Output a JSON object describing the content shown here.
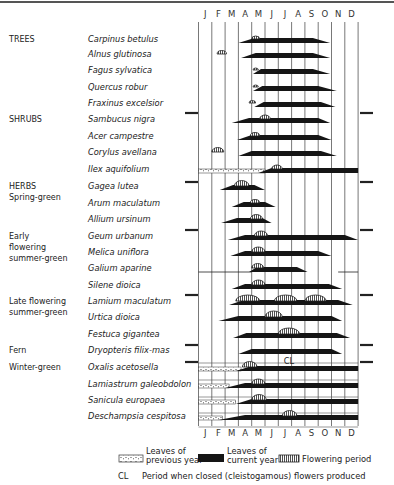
{
  "chart_data": {
    "type": "phenology-chart",
    "title": "",
    "x_axis": {
      "label": "",
      "months": [
        "J",
        "F",
        "M",
        "A",
        "M",
        "J",
        "J",
        "A",
        "S",
        "O",
        "N",
        "D"
      ]
    },
    "groups": [
      {
        "label": [
          "TREES"
        ],
        "species": [
          {
            "name": "Carpinus betulus",
            "current_leaves": [
              3.0,
              9.9,
              4.2,
              8.6
            ],
            "flower": [
              4.0,
              4.6
            ]
          },
          {
            "name": "Alnus glutinosa",
            "current_leaves": [
              3.2,
              9.9,
              4.3,
              8.6
            ],
            "flower": [
              1.4,
              2.1
            ]
          },
          {
            "name": "Fagus sylvatica",
            "current_leaves": [
              4.1,
              9.9,
              4.7,
              8.6
            ],
            "flower": [
              4.1,
              4.5
            ]
          },
          {
            "name": "Quercus robur",
            "current_leaves": [
              4.1,
              10.4,
              4.8,
              9.0
            ],
            "flower": [
              4.1,
              4.5
            ]
          },
          {
            "name": "Fraxinus excelsior",
            "current_leaves": [
              4.2,
              10.3,
              4.9,
              9.2
            ],
            "flower": [
              3.8,
              4.3
            ]
          }
        ]
      },
      {
        "label": [
          "SHRUBS"
        ],
        "species": [
          {
            "name": "Sambucus nigra",
            "current_leaves": [
              2.5,
              9.9,
              3.8,
              9.0
            ],
            "flower": [
              4.6,
              5.4
            ]
          },
          {
            "name": "Acer campestre",
            "current_leaves": [
              2.9,
              10.0,
              4.0,
              9.0
            ],
            "flower": [
              3.9,
              4.6
            ]
          },
          {
            "name": "Corylus avellana",
            "current_leaves": [
              3.0,
              10.4,
              4.0,
              9.2
            ],
            "flower": [
              1.0,
              1.9
            ]
          },
          {
            "name": "Ilex aquifolium",
            "previous_leaves": [
              0.0,
              5.0
            ],
            "current_leaves": [
              4.5,
              12.0,
              5.5,
              12.0
            ],
            "flower": [
              5.5,
              6.3
            ]
          }
        ]
      },
      {
        "label": [
          "HERBS",
          "Spring-green"
        ],
        "species": [
          {
            "name": "Gagea lutea",
            "current_leaves": [
              1.6,
              5.0,
              2.6,
              4.2
            ],
            "flower": [
              2.7,
              3.8
            ]
          },
          {
            "name": "Arum maculatum",
            "current_leaves": [
              2.5,
              5.8,
              3.4,
              5.0
            ],
            "flower": [
              3.9,
              4.6
            ]
          },
          {
            "name": "Allium ursinum",
            "current_leaves": [
              1.7,
              5.5,
              2.9,
              4.8
            ],
            "flower": [
              3.9,
              4.8
            ]
          }
        ]
      },
      {
        "label": [
          "Early",
          "flowering",
          "summer-green"
        ],
        "species": [
          {
            "name": "Geum urbanum",
            "current_leaves": [
              2.2,
              12.0,
              3.5,
              11.0
            ],
            "flower": [
              4.2,
              5.2
            ]
          },
          {
            "name": "Melica uniflora",
            "current_leaves": [
              2.4,
              10.0,
              3.5,
              9.0
            ],
            "flower": [
              4.0,
              5.0
            ]
          },
          {
            "name": "Galium aparine",
            "thin_line": [
              [
                0.0,
                4.0
              ],
              [
                10.5,
                12.0
              ]
            ],
            "current_leaves": [
              3.8,
              8.2,
              4.4,
              7.4
            ],
            "flower": [
              4.0,
              4.9
            ]
          },
          {
            "name": "Silene dioica",
            "current_leaves": [
              2.5,
              10.8,
              3.5,
              9.8
            ],
            "flower": [
              4.0,
              5.0
            ]
          }
        ]
      },
      {
        "label": [
          "Late flowering",
          "summer-green"
        ],
        "species": [
          {
            "name": "Lamium maculatum",
            "current_leaves": [
              2.3,
              11.6,
              3.4,
              10.5
            ],
            "flower": [
              2.8,
              4.6
            ],
            "flower2": [
              5.7,
              7.4
            ],
            "flower3": [
              8.0,
              9.6
            ]
          },
          {
            "name": "Urtica dioica",
            "current_leaves": [
              1.5,
              10.8,
              3.0,
              10.0
            ],
            "flower": [
              5.0,
              6.3
            ]
          },
          {
            "name": "Festuca gigantea",
            "current_leaves": [
              2.6,
              11.4,
              3.6,
              10.4
            ],
            "flower": [
              6.0,
              7.6
            ]
          }
        ]
      },
      {
        "label": [
          "Fern"
        ],
        "species": [
          {
            "name": "Dryopteris filix-mas",
            "current_leaves": [
              3.0,
              10.8,
              4.0,
              10.0
            ],
            "cl": [
              6.4,
              7.2
            ]
          }
        ]
      },
      {
        "label": [
          "Winter-green"
        ],
        "species": [
          {
            "name": "Oxalis acetosella",
            "previous_leaves": [
              0.0,
              3.2
            ],
            "current_leaves": [
              2.8,
              12.0,
              4.0,
              12.0
            ],
            "flower": [
              3.3,
              4.4
            ]
          },
          {
            "name": "Lamiastrum galeobdolon",
            "previous_leaves": [
              0.0,
              2.3
            ],
            "current_leaves": [
              2.0,
              12.0,
              3.5,
              12.0
            ],
            "flower": [
              4.0,
              5.0
            ]
          },
          {
            "name": "Sanicula europaea",
            "previous_leaves": [
              0.0,
              2.8
            ],
            "current_leaves": [
              2.8,
              12.0,
              4.0,
              12.0
            ],
            "flower": [
              4.0,
              5.1
            ]
          },
          {
            "name": "Deschampsia cespitosa",
            "previous_leaves": [
              0.0,
              1.8
            ],
            "current_leaves": [
              1.5,
              12.0,
              3.5,
              12.0
            ],
            "flower": [
              6.3,
              7.4
            ]
          }
        ]
      }
    ],
    "legend": {
      "previous_leaves": [
        "Leaves of",
        "previous year"
      ],
      "current_leaves": [
        "Leaves of",
        "current year"
      ],
      "flowering": "Flowering period",
      "cl_abbrev": "CL",
      "cl_text": "Period when closed (cleistogamous) flowers produced"
    },
    "colors": {
      "leaves": "#151515",
      "grid": "#555555",
      "text": "#222222"
    }
  }
}
